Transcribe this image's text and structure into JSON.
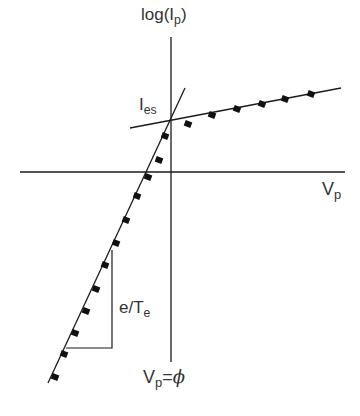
{
  "diagram": {
    "axes": {
      "y_label": {
        "base": "log(I",
        "sub": "p",
        "close": ")"
      },
      "x_label": {
        "base": "V",
        "sub": "p"
      }
    },
    "annotations": {
      "saturation_current": {
        "base": "I",
        "sub": "es"
      },
      "slope": {
        "base": "e/T",
        "sub": "e"
      },
      "plasma_potential": {
        "base": "V",
        "sub": "p",
        "rest": "=",
        "phi": "ϕ"
      }
    },
    "colors": {
      "line": "#1a1a1a",
      "marker": "#111111",
      "text": "#333333",
      "background": "#ffffff"
    }
  },
  "chart_data": {
    "type": "scatter",
    "title": "",
    "xlabel": "Vp",
    "ylabel": "log(Ip)",
    "grid": false,
    "legend": null,
    "series": [
      {
        "name": "measured points (pixel coords)",
        "points": [
          [
            55,
            377
          ],
          [
            64,
            354
          ],
          [
            75,
            333
          ],
          [
            86,
            311
          ],
          [
            96,
            289
          ],
          [
            105,
            265
          ],
          [
            116,
            243
          ],
          [
            126,
            220
          ],
          [
            137,
            196
          ],
          [
            148,
            177
          ],
          [
            159,
            160
          ],
          [
            165,
            136
          ],
          [
            188,
            124
          ],
          [
            212,
            115
          ],
          [
            237,
            109
          ],
          [
            262,
            104
          ],
          [
            285,
            99
          ],
          [
            311,
            94
          ]
        ]
      },
      {
        "name": "electron retarding fit line",
        "points": [
          [
            48,
            383
          ],
          [
            185,
            88
          ]
        ]
      },
      {
        "name": "electron saturation fit line",
        "points": [
          [
            130,
            128
          ],
          [
            341,
            88
          ]
        ]
      }
    ],
    "annotations": [
      {
        "text": "Ies",
        "at": "intersection of fit lines"
      },
      {
        "text": "e/Te",
        "at": "slope triangle"
      },
      {
        "text": "Vp=ϕ",
        "at": "vertical axis"
      }
    ]
  }
}
